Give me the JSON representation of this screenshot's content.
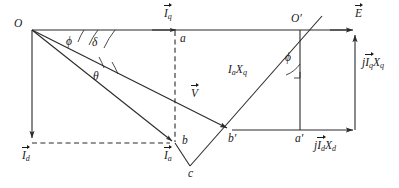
{
  "figure": {
    "type": "phasor-diagram",
    "background_color": "#ffffff",
    "line_color": "#2a2a2a",
    "text_color": "#1a1a1a"
  },
  "points": {
    "O": "O",
    "O_prime": "O′",
    "a": "a",
    "b": "b",
    "c": "c",
    "a_prime": "a′",
    "b_prime": "b′"
  },
  "angles": {
    "phi_left": "ϕ",
    "delta": "δ",
    "theta": "θ",
    "phi_right": "ϕ"
  },
  "vectors": {
    "Iq": {
      "symbol": "I",
      "sub": "q",
      "overbar": true
    },
    "Id": {
      "symbol": "I",
      "sub": "d",
      "overbar": true
    },
    "Ia": {
      "symbol": "I",
      "sub": "a",
      "overbar": true
    },
    "V": {
      "symbol": "V",
      "sub": "",
      "overbar": true
    },
    "E": {
      "symbol": "E",
      "sub": "",
      "overbar": true
    },
    "IaXq": {
      "prefix": "",
      "symbol": "I",
      "sub": "a",
      "symbol2": "X",
      "sub2": "q",
      "overbar": false
    },
    "jIqXq": {
      "prefix": "j",
      "symbol": "I",
      "sub": "q",
      "symbol2": "X",
      "sub2": "q",
      "overbar": true
    },
    "jIdXd": {
      "prefix": "j",
      "symbol": "I",
      "sub": "d",
      "symbol2": "X",
      "sub2": "d",
      "overbar": true
    }
  },
  "labels": {
    "Iq_text": "I",
    "Iq_sub": "q",
    "Id_text": "I",
    "Id_sub": "d",
    "Ia_text": "I",
    "Ia_sub": "a",
    "V_text": "V",
    "E_text": "E",
    "IaXq_I": "I",
    "IaXq_a": "a",
    "IaXq_X": "X",
    "IaXq_q": "q",
    "jIqXq_j": "j",
    "jIqXq_I": "I",
    "jIqXq_q1": "q",
    "jIqXq_X": "X",
    "jIqXq_q2": "q",
    "jIdXd_j": "j",
    "jIdXd_I": "I",
    "jIdXd_d1": "d",
    "jIdXd_X": "X",
    "jIdXd_d2": "d"
  }
}
